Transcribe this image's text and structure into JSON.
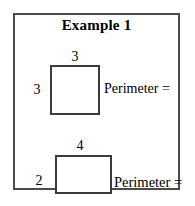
{
  "worksheet": {
    "title": "Example 1",
    "background_color": "#ffffff",
    "border_color": "#4a4a4a",
    "shape_stroke_color": "#3c3c3c",
    "text_color": "#000000",
    "problems": [
      {
        "shape": "square",
        "top_label": "3",
        "left_label": "3",
        "prompt": "Perimeter ="
      },
      {
        "shape": "rectangle",
        "top_label": "4",
        "left_label": "2",
        "prompt": "Perimeter ="
      }
    ]
  }
}
